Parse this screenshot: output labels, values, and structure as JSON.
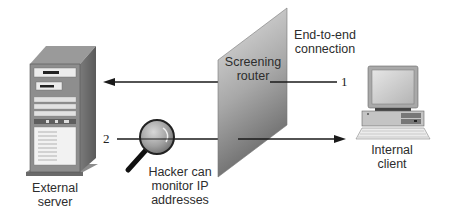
{
  "diagram": {
    "type": "network-diagram",
    "nodes": {
      "external_server": {
        "label_line1": "External",
        "label_line2": "server"
      },
      "screening_router": {
        "label_line1": "Screening",
        "label_line2": "router"
      },
      "internal_client": {
        "label_line1": "Internal",
        "label_line2": "client"
      },
      "hacker": {
        "label_line1": "Hacker can",
        "label_line2": "monitor IP",
        "label_line3": "addresses"
      }
    },
    "connections": [
      {
        "id": "1",
        "label": "1",
        "from": "internal_client",
        "to": "external_server",
        "via": "screening_router"
      },
      {
        "id": "2",
        "label": "2",
        "from": "external_server",
        "to": "internal_client",
        "via": "screening_router"
      }
    ],
    "annotation": {
      "line1": "End-to-end",
      "line2": "connection"
    },
    "colors": {
      "line": "#1a1a1a",
      "router_light": "#d9d9d9",
      "router_dark": "#6e6e6e",
      "server_body": "#8a8a8a",
      "lens": "#9a9a9a"
    }
  }
}
